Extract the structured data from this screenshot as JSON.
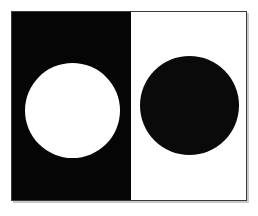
{
  "figure": {
    "frame": {
      "border_color": "#3a3a3a",
      "shadow_color": "#c9c9c9",
      "width_px": 236,
      "height_px": 190
    },
    "panels": [
      {
        "name": "left-panel",
        "background_color": "#050505",
        "background_label": "black",
        "width_px": 119,
        "disc": {
          "name": "light-disc",
          "fill_color": "#ffffff",
          "fill_label": "white",
          "diameter_px": 95,
          "center_x_px": 72,
          "center_y_px": 110
        }
      },
      {
        "name": "right-panel",
        "background_color": "#ffffff",
        "background_label": "white",
        "width_px": 117,
        "disc": {
          "name": "dark-disc",
          "fill_color": "#0a0a0a",
          "fill_label": "black",
          "diameter_px": 99,
          "center_x_px": 189,
          "center_y_px": 105
        }
      }
    ],
    "canvas": {
      "background_color": "#ffffff",
      "width_px": 258,
      "height_px": 216
    }
  }
}
